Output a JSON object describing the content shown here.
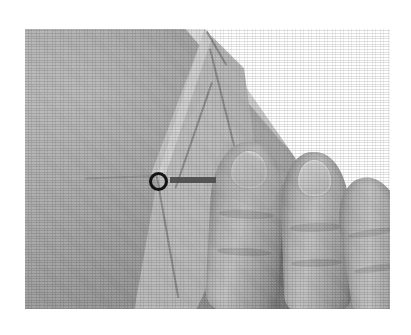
{
  "figure": {
    "kind": "grayscale-photograph",
    "background_color": "#ffffff",
    "plate": {
      "left": 25,
      "top": 29,
      "width": 365,
      "height": 280,
      "base_tone": "#a9a9a9",
      "description": "Photographic plate showing a large gray cloth panel on the left, a bright triangular fold running from the top edge down to the bottom, a white background wedge at the upper right, and three fingers of a hand entering from the right."
    },
    "regions": [
      {
        "name": "cloth-panel-left",
        "label": "Flat cloth panel",
        "tone": "#a8a8a8"
      },
      {
        "name": "fold-flap",
        "label": "Folded flap",
        "tone": "#bdbdbd"
      },
      {
        "name": "fold-kite",
        "label": "Inner kite facet of the fold",
        "tone": "#c0c0c0"
      },
      {
        "name": "background-wedge",
        "label": "White background",
        "tone": "#ffffff"
      }
    ],
    "fingers": [
      {
        "name": "finger-index",
        "label": "Index finger",
        "has_nail": true
      },
      {
        "name": "finger-middle",
        "label": "Middle finger",
        "has_nail": true
      },
      {
        "name": "finger-ring",
        "label": "Ring finger",
        "has_nail": false
      }
    ],
    "annotations": {
      "ring": {
        "label": "Reference marker ring",
        "color": "#141414",
        "center_x": 158,
        "center_y": 181,
        "diameter": 19,
        "stroke": 3
      },
      "bar": {
        "label": "Reference marker bar",
        "color": "#4a4a4a",
        "left": 170,
        "top": 177,
        "width": 46,
        "height": 6
      }
    }
  }
}
